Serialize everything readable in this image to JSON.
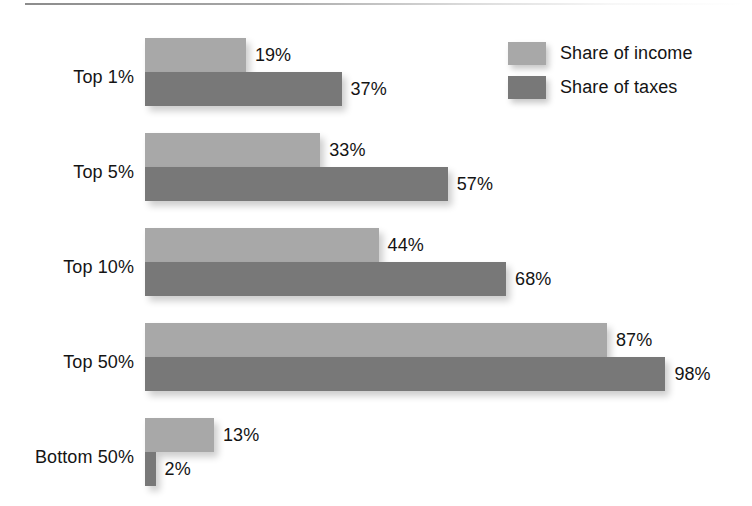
{
  "chart_data": {
    "type": "bar",
    "orientation": "horizontal",
    "title": "",
    "subtitle": "",
    "xlabel": "",
    "ylabel": "",
    "categories": [
      "Top 1%",
      "Top 5%",
      "Top 10%",
      "Top 50%",
      "Bottom 50%"
    ],
    "series": [
      {
        "name": "Share of income",
        "color": "#a8a8a8",
        "values": [
          19,
          33,
          44,
          87,
          13
        ],
        "value_labels": [
          "19%",
          "33%",
          "44%",
          "87%",
          "13%"
        ]
      },
      {
        "name": "Share of taxes",
        "color": "#787878",
        "values": [
          37,
          57,
          68,
          98,
          2
        ],
        "value_labels": [
          "37%",
          "57%",
          "68%",
          "98%",
          "2%"
        ]
      }
    ],
    "xlim": [
      0,
      100
    ],
    "grid": false,
    "legend_position": "top-right",
    "value_label_format": "percent",
    "axis_visible": false
  },
  "legend": {
    "entries": [
      {
        "label": "Share of income",
        "color": "#a8a8a8",
        "swatch": "legend-swatch-light"
      },
      {
        "label": "Share of taxes",
        "color": "#787878",
        "swatch": "legend-swatch-dark"
      }
    ]
  },
  "groups": [
    {
      "category": "Top 1%",
      "income": {
        "label": "19%",
        "value": 19
      },
      "taxes": {
        "label": "37%",
        "value": 37
      }
    },
    {
      "category": "Top 5%",
      "income": {
        "label": "33%",
        "value": 33
      },
      "taxes": {
        "label": "57%",
        "value": 57
      }
    },
    {
      "category": "Top 10%",
      "income": {
        "label": "44%",
        "value": 44
      },
      "taxes": {
        "label": "68%",
        "value": 68
      }
    },
    {
      "category": "Top 50%",
      "income": {
        "label": "87%",
        "value": 87
      },
      "taxes": {
        "label": "98%",
        "value": 98
      }
    },
    {
      "category": "Bottom 50%",
      "income": {
        "label": "13%",
        "value": 13
      },
      "taxes": {
        "label": "2%",
        "value": 2
      }
    }
  ],
  "style": {
    "light_color": "#a8a8a8",
    "dark_color": "#787878",
    "text_color": "#141414",
    "background": "#ffffff",
    "px_per_percent": 5.31,
    "bar_origin_x": 145,
    "bar_height": 34
  },
  "layout": {
    "group_tops": [
      38,
      133,
      228,
      323,
      418
    ]
  }
}
